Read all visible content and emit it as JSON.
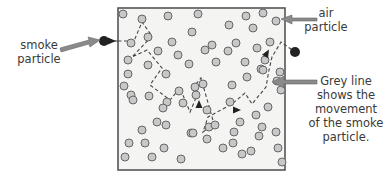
{
  "diagram": {
    "labels": {
      "smoke_particle": [
        "smoke",
        "particle"
      ],
      "air_particle": [
        "air",
        "particle"
      ],
      "grey_line": [
        "Grey line",
        "shows the",
        "movement",
        "of the smoke",
        "particle."
      ]
    },
    "colors": {
      "box_border": "#555555",
      "box_fill": "#f4f4f2",
      "air_particle_fill": "#c8c8c8",
      "air_particle_stroke": "#666666",
      "smoke_particle": "#222222",
      "path_line": "#444444",
      "pointer_arrow": "#8a8a8a",
      "text": "#3a3a3a"
    },
    "box": {
      "x": 118,
      "y": 8,
      "width": 167,
      "height": 162
    },
    "smoke_start": {
      "x": 104,
      "y": 41
    },
    "smoke_end": {
      "x": 295,
      "y": 52
    },
    "path_points": [
      [
        118,
        41
      ],
      [
        134,
        41
      ],
      [
        142,
        22
      ],
      [
        152,
        36
      ],
      [
        132,
        57
      ],
      [
        147,
        50
      ],
      [
        162,
        68
      ],
      [
        150,
        85
      ],
      [
        170,
        100
      ],
      [
        180,
        88
      ],
      [
        190,
        112
      ],
      [
        198,
        93
      ],
      [
        196,
        84
      ],
      [
        201,
        78
      ],
      [
        214,
        124
      ],
      [
        203,
        132
      ],
      [
        208,
        117
      ],
      [
        232,
        104
      ],
      [
        245,
        93
      ],
      [
        252,
        104
      ],
      [
        266,
        87
      ],
      [
        269,
        70
      ],
      [
        272,
        57
      ],
      [
        281,
        42
      ],
      [
        295,
        52
      ]
    ],
    "air_particles": [
      [
        123,
        14
      ],
      [
        142,
        19
      ],
      [
        168,
        16
      ],
      [
        198,
        14
      ],
      [
        246,
        16
      ],
      [
        263,
        13
      ],
      [
        276,
        21
      ],
      [
        192,
        32
      ],
      [
        148,
        37
      ],
      [
        131,
        43
      ],
      [
        172,
        42
      ],
      [
        229,
        25
      ],
      [
        253,
        28
      ],
      [
        178,
        55
      ],
      [
        236,
        43
      ],
      [
        212,
        45
      ],
      [
        205,
        50
      ],
      [
        228,
        51
      ],
      [
        257,
        48
      ],
      [
        128,
        60
      ],
      [
        158,
        51
      ],
      [
        216,
        62
      ],
      [
        270,
        42
      ],
      [
        148,
        65
      ],
      [
        189,
        64
      ],
      [
        245,
        62
      ],
      [
        265,
        60
      ],
      [
        261,
        69
      ],
      [
        128,
        74
      ],
      [
        166,
        74
      ],
      [
        131,
        95
      ],
      [
        133,
        100
      ],
      [
        167,
        102
      ],
      [
        207,
        110
      ],
      [
        149,
        96
      ],
      [
        179,
        91
      ],
      [
        232,
        85
      ],
      [
        263,
        70
      ],
      [
        280,
        72
      ],
      [
        124,
        86
      ],
      [
        163,
        108
      ],
      [
        183,
        103
      ],
      [
        195,
        87
      ],
      [
        196,
        95
      ],
      [
        203,
        84
      ],
      [
        191,
        133
      ],
      [
        230,
        102
      ],
      [
        247,
        77
      ],
      [
        277,
        81
      ],
      [
        157,
        122
      ],
      [
        209,
        127
      ],
      [
        240,
        122
      ],
      [
        256,
        115
      ],
      [
        268,
        107
      ],
      [
        281,
        90
      ],
      [
        129,
        143
      ],
      [
        145,
        143
      ],
      [
        152,
        157
      ],
      [
        164,
        148
      ],
      [
        181,
        159
      ],
      [
        193,
        133
      ],
      [
        207,
        139
      ],
      [
        223,
        148
      ],
      [
        233,
        143
      ],
      [
        242,
        154
      ],
      [
        259,
        136
      ],
      [
        276,
        132
      ],
      [
        278,
        148
      ],
      [
        282,
        162
      ],
      [
        166,
        125
      ],
      [
        215,
        125
      ],
      [
        251,
        151
      ],
      [
        125,
        157
      ],
      [
        142,
        130
      ],
      [
        234,
        132
      ],
      [
        262,
        127
      ]
    ],
    "direction_arrows": [
      [
        112,
        41,
        0
      ],
      [
        267,
        53,
        -60
      ],
      [
        199,
        104,
        -90
      ],
      [
        237,
        110,
        0
      ]
    ]
  }
}
